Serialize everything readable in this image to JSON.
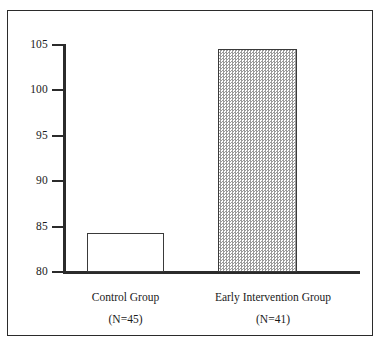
{
  "chart_data": {
    "type": "bar",
    "title": "",
    "subtitle": "",
    "xlabel": "",
    "ylabel": "",
    "categories": [
      "Control Group",
      "Early Intervention Group"
    ],
    "category_sublabels": [
      "(N=45)",
      "(N=41)"
    ],
    "values": [
      84.3,
      104.6
    ],
    "ylim": [
      80,
      105
    ],
    "yticks": [
      80,
      85,
      90,
      95,
      100,
      105
    ],
    "ytick_labels": [
      "80",
      "85",
      "90",
      "95",
      "100",
      "105"
    ],
    "grid": false,
    "legend": "none",
    "series": [
      {
        "name": "IQ score",
        "values": [
          84.3,
          104.6
        ]
      }
    ],
    "bar_styles": [
      "white-outline",
      "gray-checkerboard-fill"
    ],
    "colors": {
      "axis": "#2b2b2b",
      "bar_outline": "#3a3a3a",
      "bar_fill_control": "#ffffff",
      "bar_fill_intervention": "#9a9a9a",
      "frame": "#2b2b2b",
      "text": "#1a1a1a",
      "background": "#ffffff"
    }
  },
  "axis": {
    "ticks": [
      {
        "label": "105",
        "value": 105
      },
      {
        "label": "100",
        "value": 100
      },
      {
        "label": "95",
        "value": 95
      },
      {
        "label": "90",
        "value": 90
      },
      {
        "label": "85",
        "value": 85
      },
      {
        "label": "80",
        "value": 80
      }
    ]
  },
  "bars": [
    {
      "name": "Control Group",
      "sublabel": "(N=45)",
      "value": 84.3
    },
    {
      "name": "Early Intervention Group",
      "sublabel": "(N=41)",
      "value": 104.6
    }
  ]
}
